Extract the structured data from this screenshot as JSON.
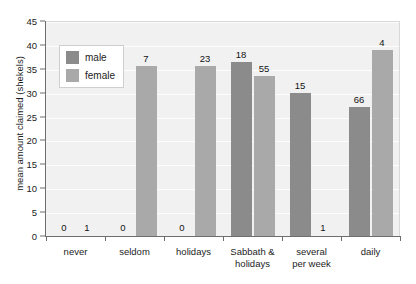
{
  "chart_data": {
    "type": "bar",
    "title": "",
    "subtitle": "",
    "xlabel": "",
    "ylabel": "mean amount claimed (shekels)",
    "categories": [
      "never",
      "seldom",
      "holidays",
      "Sabbath &\nholidays",
      "several\nper week",
      "daily"
    ],
    "ylim": [
      0,
      45
    ],
    "yticks": [
      0,
      5,
      10,
      15,
      20,
      25,
      30,
      35,
      40,
      45
    ],
    "ytick_labels": [
      "0",
      "5",
      "10",
      "15",
      "20",
      "25",
      "30",
      "35",
      "40",
      "45"
    ],
    "grid": true,
    "legend_position": "upper left",
    "series": [
      {
        "name": "male",
        "color": "#8b8b8b",
        "values": [
          0,
          0,
          0,
          36.5,
          30.0,
          27.0
        ],
        "counts": [
          0,
          0,
          0,
          18,
          15,
          66
        ]
      },
      {
        "name": "female",
        "color": "#a9a9a9",
        "values": [
          0,
          35.6,
          35.6,
          33.5,
          0,
          39.0
        ],
        "counts": [
          1,
          7,
          23,
          55,
          1,
          4
        ]
      }
    ],
    "annotations_note": "numbers above each bar are sample sizes (n)"
  },
  "legend": {
    "items": [
      {
        "label": "male",
        "color": "#8b8b8b"
      },
      {
        "label": "female",
        "color": "#a9a9a9"
      }
    ]
  },
  "colors": {
    "male": "#8b8b8b",
    "female": "#a9a9a9",
    "plot_background": "#f1f1f1",
    "gridline": "#ffffff",
    "axis": "#6e6e6e",
    "text": "#1d1d1d",
    "page_background": "#ffffff"
  }
}
